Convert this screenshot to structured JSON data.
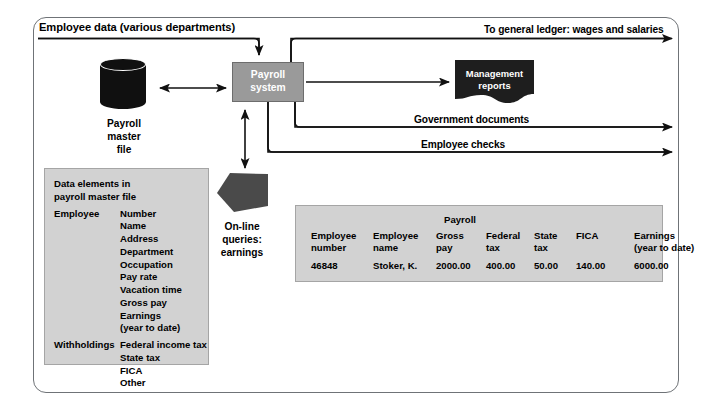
{
  "diagram": {
    "title_caption": "Employee data (various departments)",
    "flow_labels": {
      "ledger": "To general ledger: wages and salaries",
      "government_documents": "Government documents",
      "employee_checks": "Employee checks"
    },
    "nodes": {
      "master_file": {
        "icon": "cylinder-database-icon",
        "label": "Payroll\nmaster\nfile",
        "label_lines": [
          "Payroll",
          "master",
          "file"
        ],
        "color": "#101010"
      },
      "payroll_system": {
        "label_lines": [
          "Payroll",
          "system"
        ],
        "fill": "#9a9a9a",
        "text_color": "#ffffff"
      },
      "management_reports": {
        "icon": "document-wavy-icon",
        "label_lines": [
          "Management",
          "reports"
        ],
        "fill": "#1e1e1e",
        "text_color": "#ffffff"
      },
      "online_queries": {
        "icon": "pentagon-display-icon",
        "label_lines": [
          "On-line",
          "queries:",
          "earnings"
        ],
        "fill": "#4a4a4a"
      }
    },
    "data_panel": {
      "heading_lines": [
        "Data elements in",
        "payroll master file"
      ],
      "groups": [
        {
          "name": "Employee",
          "items": [
            "Number",
            "Name",
            "Address",
            "Department",
            "Occupation",
            "Pay rate",
            "Vacation time",
            "Gross pay",
            "Earnings",
            "(year to date)"
          ]
        },
        {
          "name": "Withholdings",
          "items": [
            "Federal income tax",
            "State tax",
            "FICA",
            "Other"
          ]
        }
      ]
    },
    "record_table": {
      "group_header": "Payroll",
      "columns": [
        {
          "header": "Employee\nnumber",
          "value": "46848"
        },
        {
          "header": "Employee\nname",
          "value": "Stoker, K."
        },
        {
          "header": "Gross\npay",
          "value": "2000.00"
        },
        {
          "header": "Federal\ntax",
          "value": "400.00"
        },
        {
          "header": "State\ntax",
          "value": "50.00"
        },
        {
          "header": "FICA\n",
          "value": "140.00"
        },
        {
          "header": "Earnings\n(year to date)",
          "value": "6000.00"
        }
      ]
    },
    "colors": {
      "frame_border": "#6f7377",
      "panel_fill": "#d2d2d2",
      "panel_border": "#a5a5a5",
      "process_fill": "#9a9a9a",
      "dark_fill": "#101010",
      "line": "#111111"
    }
  }
}
